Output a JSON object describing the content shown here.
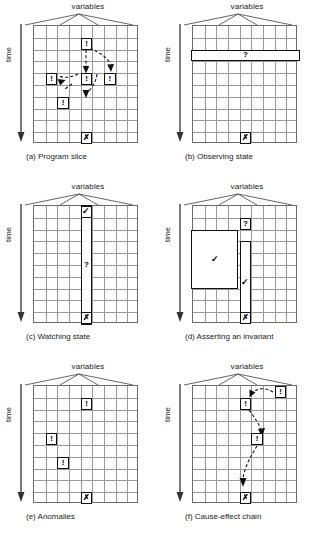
{
  "figure": {
    "axis_labels": {
      "variables": "variables",
      "time": "time"
    },
    "glyphs": {
      "warning": "!",
      "failure": "✗",
      "pass": "✓",
      "unknown": "?"
    },
    "grid": {
      "columns": 9,
      "rows": 10
    },
    "panels": [
      {
        "id": "a",
        "caption": "(a) Program slice",
        "variables_label": "variables",
        "time_label": "time",
        "cells": [
          {
            "glyph": "!",
            "row": 2,
            "col": 5
          },
          {
            "glyph": "!",
            "row": 5,
            "col": 2
          },
          {
            "glyph": "!",
            "row": 5,
            "col": 5
          },
          {
            "glyph": "!",
            "row": 5,
            "col": 7
          },
          {
            "glyph": "!",
            "row": 7,
            "col": 3
          },
          {
            "glyph": "✗",
            "row": 10,
            "col": 5
          }
        ]
      },
      {
        "id": "b",
        "caption": "(b) Observing state",
        "variables_label": "variables",
        "time_label": "time",
        "bands": [
          {
            "glyph": "?",
            "orientation": "row",
            "row": 3
          }
        ],
        "cells": [
          {
            "glyph": "✗",
            "row": 10,
            "col": 5
          }
        ]
      },
      {
        "id": "c",
        "caption": "(c) Watching state",
        "variables_label": "variables",
        "time_label": "time",
        "bands": [
          {
            "glyph": "?",
            "orientation": "column",
            "col": 5,
            "row_start": 1,
            "row_end": 10
          }
        ],
        "cells": [
          {
            "glyph": "✓",
            "row": 1,
            "col": 5
          },
          {
            "glyph": "✗",
            "row": 10,
            "col": 5
          }
        ]
      },
      {
        "id": "d",
        "caption": "(d) Asserting an invariant",
        "variables_label": "variables",
        "time_label": "time",
        "blocks": [
          {
            "glyph": "✓",
            "row_start": 3,
            "row_end": 8,
            "col_start": 1,
            "col_end": 4
          },
          {
            "glyph": "✓",
            "row_start": 4,
            "row_end": 10,
            "col_start": 5,
            "col_end": 5
          }
        ],
        "cells": [
          {
            "glyph": "?",
            "row": 2,
            "col": 5
          },
          {
            "glyph": "✗",
            "row": 10,
            "col": 5
          }
        ]
      },
      {
        "id": "e",
        "caption": "(e) Anomalies",
        "variables_label": "variables",
        "time_label": "time",
        "cells": [
          {
            "glyph": "!",
            "row": 2,
            "col": 5
          },
          {
            "glyph": "!",
            "row": 5,
            "col": 2
          },
          {
            "glyph": "!",
            "row": 7,
            "col": 3
          },
          {
            "glyph": "✗",
            "row": 10,
            "col": 5
          }
        ]
      },
      {
        "id": "f",
        "caption": "(f) Cause-effect chain",
        "variables_label": "variables",
        "time_label": "time",
        "cells": [
          {
            "glyph": "!",
            "row": 1,
            "col": 8
          },
          {
            "glyph": "!",
            "row": 2,
            "col": 5
          },
          {
            "glyph": "!",
            "row": 5,
            "col": 6
          },
          {
            "glyph": "✗",
            "row": 10,
            "col": 5
          }
        ]
      }
    ]
  }
}
